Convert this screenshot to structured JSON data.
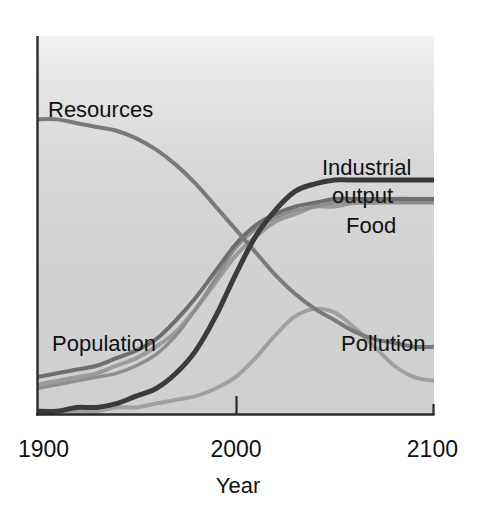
{
  "chart_data": {
    "type": "line",
    "title": "",
    "subtitle": "",
    "xlabel": "Year",
    "ylabel": "",
    "xlim": [
      1900,
      2100
    ],
    "ylim": [
      0,
      100
    ],
    "grid": false,
    "legend_position": "inline-labels",
    "xticks": [
      "1900",
      "2000",
      "2100"
    ],
    "xtick_values": [
      1900,
      2000,
      2100
    ],
    "yticks": [],
    "background_color": "#d2d2d2",
    "annotations": [
      {
        "text": "Resources",
        "x": 1905,
        "y": 77
      },
      {
        "text": "Industrial",
        "x": 2058,
        "y": 60
      },
      {
        "text": "output",
        "x": 2062,
        "y": 53
      },
      {
        "text": "Food",
        "x": 2072,
        "y": 45
      },
      {
        "text": "Population",
        "x": 1912,
        "y": 21
      },
      {
        "text": "Pollution",
        "x": 2055,
        "y": 20
      }
    ],
    "series": [
      {
        "name": "Resources",
        "color": "#7a7a7a",
        "width": 4.0,
        "x": [
          1900,
          1910,
          1920,
          1930,
          1940,
          1950,
          1960,
          1970,
          1980,
          1990,
          2000,
          2010,
          2020,
          2030,
          2040,
          2050,
          2060,
          2070,
          2080,
          2090,
          2100
        ],
        "values": [
          78,
          78,
          77,
          76,
          75,
          73,
          70,
          66,
          61,
          55,
          49,
          43,
          37,
          32,
          28,
          25,
          22,
          20,
          19,
          18,
          18
        ]
      },
      {
        "name": "Industrial output",
        "color": "#3b3b3b",
        "width": 5.0,
        "x": [
          1900,
          1910,
          1920,
          1930,
          1940,
          1950,
          1960,
          1970,
          1980,
          1990,
          2000,
          2010,
          2020,
          2030,
          2040,
          2050,
          2060,
          2070,
          2080,
          2090,
          2100
        ],
        "values": [
          1,
          1,
          2,
          2,
          3,
          5,
          7,
          11,
          17,
          26,
          37,
          47,
          54,
          59,
          61,
          62,
          62,
          62,
          62,
          62,
          62
        ]
      },
      {
        "name": "Food",
        "color": "#9a9a9a",
        "width": 4.0,
        "x": [
          1900,
          1910,
          1920,
          1930,
          1940,
          1950,
          1960,
          1970,
          1980,
          1990,
          2000,
          2010,
          2020,
          2030,
          2040,
          2050,
          2060,
          2070,
          2080,
          2090,
          2100
        ],
        "values": [
          8,
          9,
          10,
          11,
          13,
          15,
          18,
          22,
          28,
          35,
          42,
          47,
          51,
          53,
          55,
          55,
          56,
          56,
          57,
          57,
          57
        ]
      },
      {
        "name": "Population A",
        "color": "#6e6e6e",
        "width": 4.0,
        "x": [
          1900,
          1910,
          1920,
          1930,
          1940,
          1950,
          1960,
          1970,
          1980,
          1990,
          2000,
          2010,
          2020,
          2030,
          2040,
          2050,
          2060,
          2070,
          2080,
          2090,
          2100
        ],
        "values": [
          10,
          11,
          12,
          13,
          15,
          17,
          20,
          25,
          31,
          38,
          45,
          50,
          53,
          55,
          56,
          57,
          57,
          57,
          57,
          57,
          57
        ]
      },
      {
        "name": "Population B",
        "color": "#8e8e8e",
        "width": 3.5,
        "x": [
          1900,
          1910,
          1920,
          1930,
          1940,
          1950,
          1960,
          1970,
          1980,
          1990,
          2000,
          2010,
          2020,
          2030,
          2040,
          2050,
          2060,
          2070,
          2080,
          2090,
          2100
        ],
        "values": [
          7,
          8,
          9,
          10,
          11,
          13,
          16,
          21,
          28,
          36,
          44,
          49,
          52,
          54,
          55,
          56,
          56,
          56,
          56,
          56,
          56
        ]
      },
      {
        "name": "Pollution",
        "color": "#a0a0a0",
        "width": 4.0,
        "x": [
          1900,
          1910,
          1920,
          1930,
          1940,
          1950,
          1960,
          1970,
          1980,
          1990,
          2000,
          2010,
          2020,
          2030,
          2040,
          2050,
          2060,
          2070,
          2080,
          2090,
          2100
        ],
        "values": [
          1,
          1,
          1,
          1,
          2,
          2,
          3,
          4,
          5,
          7,
          10,
          15,
          21,
          26,
          28,
          27,
          23,
          18,
          13,
          10,
          9
        ]
      }
    ]
  },
  "figure": {
    "plot_left": 37,
    "plot_right": 434,
    "plot_top": 36,
    "plot_bottom": 415,
    "axis_color": "#2a2a2a",
    "tick_2000_x": 236
  }
}
